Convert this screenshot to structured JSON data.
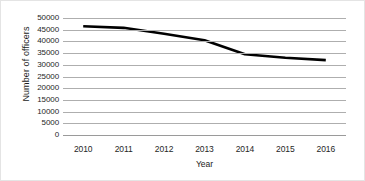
{
  "chart_data": {
    "type": "line",
    "title": "",
    "xlabel": "Year",
    "ylabel": "Number of officers",
    "categories": [
      "2010",
      "2011",
      "2012",
      "2013",
      "2014",
      "2015",
      "2016"
    ],
    "values": [
      46500,
      45800,
      43300,
      40500,
      34500,
      33000,
      32000
    ],
    "series": [
      {
        "name": "Number of officers",
        "values": [
          46500,
          45800,
          43300,
          40500,
          34500,
          33000,
          32000
        ]
      }
    ],
    "x": [
      2010,
      2011,
      2012,
      2013,
      2014,
      2015,
      2016
    ],
    "ylim": [
      0,
      50000
    ],
    "ytick_labels": [
      "50000",
      "45000",
      "40000",
      "35000",
      "30000",
      "25000",
      "20000",
      "15000",
      "10000",
      "5000",
      "0"
    ],
    "ytick_values": [
      50000,
      45000,
      40000,
      35000,
      30000,
      25000,
      20000,
      15000,
      10000,
      5000,
      0
    ],
    "ytick_step": 5000,
    "grid": true,
    "grid_axis": "y",
    "legend": false,
    "legend_position": "none",
    "line_color": "#000000",
    "grid_color": "#aeaeae",
    "background_color": "#ffffff",
    "text_color": "#262626"
  }
}
